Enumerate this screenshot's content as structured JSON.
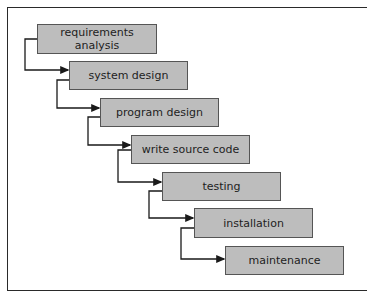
{
  "diagram": {
    "type": "waterfall-process",
    "colors": {
      "box_fill": "#bdbdbd",
      "box_border": "#555555",
      "text": "#1e1e1e",
      "connector": "#1a1a1a",
      "frame": "#2a2a2a",
      "background": "#ffffff"
    },
    "stages": [
      {
        "label_line1": "requirements",
        "label_line2": "analysis"
      },
      {
        "label": "system design"
      },
      {
        "label": "program design"
      },
      {
        "label": "write source code"
      },
      {
        "label": "testing"
      },
      {
        "label": "installation"
      },
      {
        "label": "maintenance"
      }
    ]
  }
}
